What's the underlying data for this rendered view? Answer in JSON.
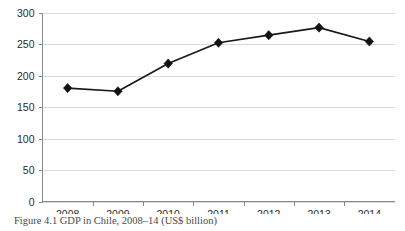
{
  "caption": "Figure 4.1 GDP in Chile, 2008–14 (US$ billion)",
  "chart_data": {
    "type": "line",
    "title": "",
    "xlabel": "",
    "ylabel": "",
    "categories": [
      "2008",
      "2009",
      "2010",
      "2011",
      "2012",
      "2013",
      "2014"
    ],
    "values": [
      180,
      175,
      219,
      252,
      264,
      276,
      254
    ],
    "series": [
      {
        "name": "GDP in Chile (US$ billion)",
        "values": [
          180,
          175,
          219,
          252,
          264,
          276,
          254
        ]
      }
    ],
    "ylim": [
      0,
      300
    ],
    "yticks": [
      0,
      50,
      100,
      150,
      200,
      250,
      300
    ],
    "ytick_labels": [
      "0",
      "50",
      "100",
      "150",
      "200",
      "250",
      "300"
    ],
    "xtick_labels": [
      "2008",
      "2009",
      "2010",
      "2011",
      "2012",
      "2013",
      "2014"
    ],
    "grid": "horizontal",
    "legend": "none",
    "marker": "diamond",
    "line_color": "#1a1a1a",
    "grid_color": "#d9d9d9",
    "axis_color": "#8a8a8a"
  }
}
